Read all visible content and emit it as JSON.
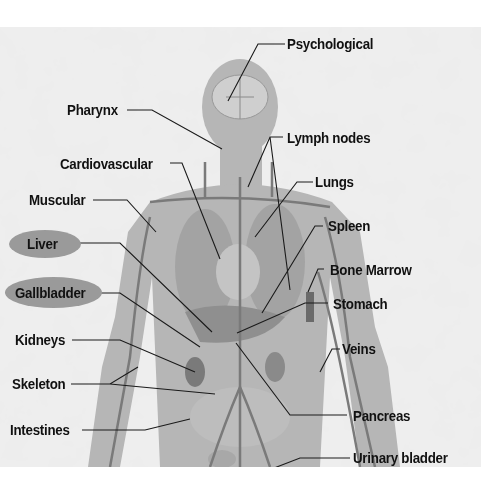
{
  "diagram": {
    "colors": {
      "background": "#e2e2e2",
      "body": "#b4b4b4",
      "organ": "#8a8a8a",
      "vessel": "#6e6e6e",
      "leader": "#1a1a1a",
      "label_text": "#111111",
      "highlight": "#9a9a9a"
    },
    "labels": {
      "psychological": "Psychological",
      "pharynx": "Pharynx",
      "lymph_nodes": "Lymph nodes",
      "cardiovascular": "Cardiovascular",
      "lungs": "Lungs",
      "muscular": "Muscular",
      "spleen": "Spleen",
      "liver": "Liver",
      "bone_marrow": "Bone Marrow",
      "gallbladder": "Gallbladder",
      "stomach": "Stomach",
      "kidneys": "Kidneys",
      "veins": "Veins",
      "skeleton": "Skeleton",
      "pancreas": "Pancreas",
      "intestines": "Intestines",
      "urinary_bladder": "Urinary bladder"
    },
    "highlighted": [
      "Liver",
      "Gallbladder"
    ]
  }
}
